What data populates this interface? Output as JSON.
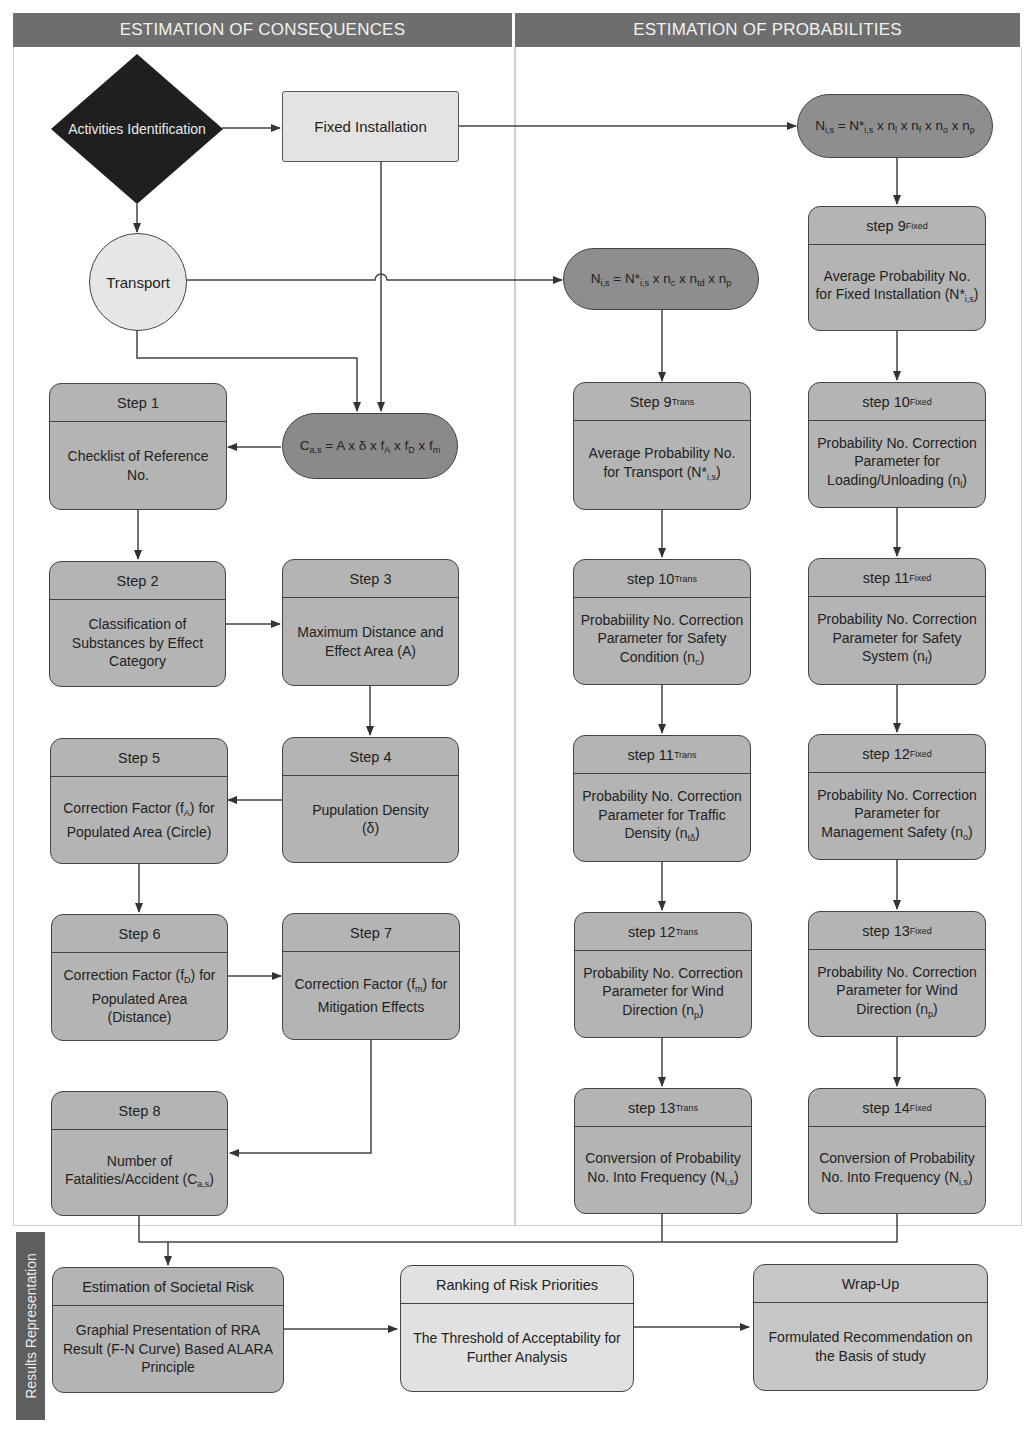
{
  "headers": {
    "left": "ESTIMATION OF CONSEQUENCES",
    "right": "ESTIMATION OF PROBABILITIES"
  },
  "side_label": "Results Representation",
  "nodes": {
    "activities": "Activities Identification",
    "fixed_installation": "Fixed Installation",
    "transport": "Transport",
    "formula_consequence": {
      "base": "C",
      "sub": "a,s",
      "rest": " = A x δ x f",
      "parts": [
        {
          "t": "C",
          "s": "a,s"
        },
        {
          "t": " = A x δ x f",
          "s": "A"
        },
        {
          "t": " x f",
          "s": "D"
        },
        {
          "t": " x f",
          "s": "m"
        }
      ]
    },
    "formula_transport": {
      "parts": [
        {
          "t": "N",
          "s": "i,s"
        },
        {
          "t": " = N*",
          "s": "i,s"
        },
        {
          "t": " x n",
          "s": "c"
        },
        {
          "t": " x n",
          "s": "td"
        },
        {
          "t": " x n",
          "s": "p"
        }
      ]
    },
    "formula_fixed": {
      "parts": [
        {
          "t": "N",
          "s": "i,s"
        },
        {
          "t": " = N*",
          "s": "i,s"
        },
        {
          "t": " x n",
          "s": "l"
        },
        {
          "t": " x n",
          "s": "f"
        },
        {
          "t": " x n",
          "s": "o"
        },
        {
          "t": " x n",
          "s": "p"
        }
      ]
    }
  },
  "consequence_steps": [
    {
      "id": "step1",
      "title": "Step 1",
      "body": "Checklist of Reference No."
    },
    {
      "id": "step2",
      "title": "Step 2",
      "body": "Classification of Substances by Effect Category"
    },
    {
      "id": "step3",
      "title": "Step 3",
      "body": "Maximum Distance and Effect Area (A)"
    },
    {
      "id": "step4",
      "title": "Step 4",
      "body": "Pupulation Density",
      "body_extra": "(δ)"
    },
    {
      "id": "step5",
      "title": "Step 5",
      "body": "Correction Factor (f",
      "body_sub": "A",
      "body_tail": ") for Populated Area (Circle)"
    },
    {
      "id": "step6",
      "title": "Step 6",
      "body": "Correction Factor (f",
      "body_sub": "D",
      "body_tail": ") for Populated Area (Distance)"
    },
    {
      "id": "step7",
      "title": "Step 7",
      "body": "Correction Factor (f",
      "body_sub": "m",
      "body_tail": ") for Mitigation Effects"
    },
    {
      "id": "step8",
      "title": "Step 8",
      "body": "Number of Fatalities/Accident (C",
      "body_sub": "a,s",
      "body_tail": ")"
    }
  ],
  "transport_steps": [
    {
      "id": "step9t",
      "title": "Step 9",
      "title_sub": "Trans",
      "body": "Average Probability No. for Transport (N*",
      "body_sub": "i,s",
      "body_tail": ")"
    },
    {
      "id": "step10t",
      "title": "step 10",
      "title_sub": "Trans",
      "body": "Probabiility No. Correction Parameter for Safety Condition (n",
      "body_sub": "c",
      "body_tail": ")"
    },
    {
      "id": "step11t",
      "title": "step 11",
      "title_sub": "Trans",
      "body": "Probability No. Correction Parameter for Traffic Density (n",
      "body_sub": "tδ",
      "body_tail": ")"
    },
    {
      "id": "step12t",
      "title": "step 12",
      "title_sub": "Trans",
      "body": "Probability No. Correction Parameter for Wind Direction (n",
      "body_sub": "p",
      "body_tail": ")"
    },
    {
      "id": "step13t",
      "title": "step 13",
      "title_sub": "Trans",
      "body": "Conversion of Probability No. Into Frequency (N",
      "body_sub": "i,s",
      "body_tail": ")"
    }
  ],
  "fixed_steps": [
    {
      "id": "step9f",
      "title": "step 9",
      "title_sub": "Fixed",
      "body": "Average Probability No. for Fixed Installation (N*",
      "body_sub": "i,s",
      "body_tail": ")"
    },
    {
      "id": "step10f",
      "title": "step 10",
      "title_sub": "Fixed",
      "body": "Probability No. Correction Parameter for Loading/Unloading (n",
      "body_sub": "l",
      "body_tail": ")"
    },
    {
      "id": "step11f",
      "title": "step 11",
      "title_sub": "Fixed",
      "body": "Probability No. Correction Parameter for Safety System (n",
      "body_sub": "f",
      "body_tail": ")"
    },
    {
      "id": "step12f",
      "title": "step 12",
      "title_sub": "Fixed",
      "body": "Probability No. Correction Parameter for Management Safety (n",
      "body_sub": "o",
      "body_tail": ")"
    },
    {
      "id": "step13f",
      "title": "step 13",
      "title_sub": "Fixed",
      "body": "Probability No. Correction Parameter for Wind Direction (n",
      "body_sub": "p",
      "body_tail": ")"
    },
    {
      "id": "step14f",
      "title": "step 14",
      "title_sub": "Fixed",
      "body": "Conversion of Probability No. Into Frequency (N",
      "body_sub": "i,s",
      "body_tail": ")"
    }
  ],
  "results": [
    {
      "id": "societal",
      "title": "Estimation of Societal Risk",
      "body": "Graphial Presentation of RRA Result (F-N Curve) Based ALARA Principle"
    },
    {
      "id": "ranking",
      "title": "Ranking of Risk Priorities",
      "body": "The Threshold of Acceptability for Further Analysis"
    },
    {
      "id": "wrapup",
      "title": "Wrap-Up",
      "body": "Formulated Recommendation on the Basis of study"
    }
  ],
  "colors": {
    "header_bg": "#6e6e6e",
    "box_dark": "#b4b4b4",
    "box_light": "#e1e1e1",
    "pill": "#8e8e8e",
    "diamond": "#1f1f1f"
  }
}
